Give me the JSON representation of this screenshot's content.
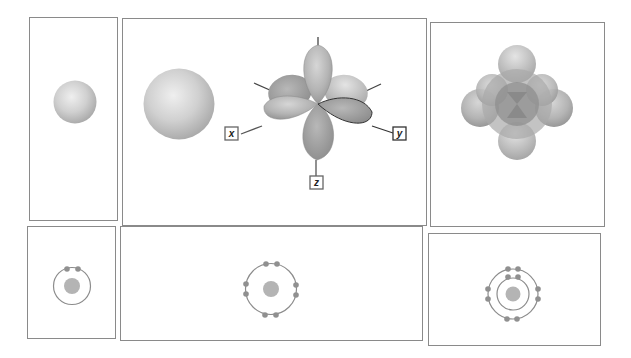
{
  "figure": {
    "colors": {
      "panel_border": "#8a8a8a",
      "orbital_fill": "#c8c8c8",
      "orbital_shade": "#9e9e9e",
      "electron": "#909090",
      "nucleus": "#b4b4b4",
      "shell": "#8c8c8c"
    },
    "top_row": [
      {
        "id": "panel-1s",
        "content": "1s orbital sphere (small)"
      },
      {
        "id": "panel-2s-2p",
        "content": "2s orbital sphere (large) and three 2p orbitals along axes",
        "axes": {
          "x": "x",
          "y": "y",
          "z": "z"
        }
      },
      {
        "id": "panel-combined",
        "content": "Superimposed 2s and 2p orbitals"
      }
    ],
    "bottom_row": [
      {
        "id": "shell-first",
        "shells": 1,
        "electrons": [
          2
        ]
      },
      {
        "id": "shell-second",
        "shells": 1,
        "electrons": [
          8
        ]
      },
      {
        "id": "shell-neon",
        "shells": 2,
        "electrons": [
          2,
          8
        ]
      }
    ]
  }
}
